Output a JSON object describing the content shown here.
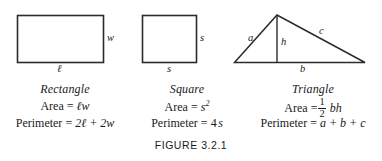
{
  "figure": {
    "caption": "FIGURE 3.2.1",
    "stroke_color": "#2b2b2b",
    "text_color": "#1a1a1a",
    "background_color": "#ffffff"
  },
  "panels": [
    {
      "id": "rectangle",
      "name": "Rectangle",
      "dimension_labels": {
        "width_side": "w",
        "length_side": "ℓ"
      },
      "area": {
        "label": "Area",
        "equals": "=",
        "expression": "ℓw"
      },
      "perimeter": {
        "label": "Perimeter",
        "equals": "=",
        "expression": "2ℓ + 2w",
        "terms": [
          "2ℓ",
          "+",
          "2w"
        ]
      }
    },
    {
      "id": "square",
      "name": "Square",
      "dimension_labels": {
        "right_side": "s",
        "bottom_side": "s"
      },
      "area": {
        "label": "Area",
        "equals": "=",
        "expression": "s²",
        "base": "s",
        "exponent": "2"
      },
      "perimeter": {
        "label": "Perimeter",
        "equals": "=",
        "expression": "4s",
        "coefficient": "4",
        "variable": "s"
      }
    },
    {
      "id": "triangle",
      "name": "Triangle",
      "dimension_labels": {
        "left_side": "a",
        "height": "h",
        "right_side": "c",
        "base": "b"
      },
      "area": {
        "label": "Area",
        "equals": "=",
        "expression": "½ bh",
        "fraction_numerator": "1",
        "fraction_denominator": "2",
        "product": "bh"
      },
      "perimeter": {
        "label": "Perimeter",
        "equals": "=",
        "expression": "a + b + c",
        "terms": [
          "a",
          "+",
          "b",
          "+",
          "c"
        ]
      }
    }
  ]
}
